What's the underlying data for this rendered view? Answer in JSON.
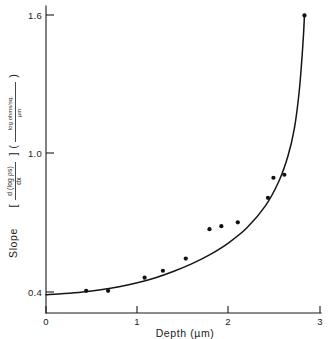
{
  "chart_data": {
    "type": "scatter",
    "title": "",
    "xlabel": "Depth  (µm)",
    "ylabel": "Slope [ d(log ρs)/dx ] ( log ohms/sq. / µm )",
    "xlim": [
      0,
      3
    ],
    "ylim": [
      0.4,
      1.6
    ],
    "xticks": [
      "0",
      "1",
      "2",
      "3"
    ],
    "xtick_values": [
      0,
      1,
      2,
      3
    ],
    "yticks": [
      "0.4",
      "1.0",
      "1.6"
    ],
    "ytick_values": [
      0.4,
      1.0,
      1.6
    ],
    "grid": false,
    "legend": "none",
    "series": [
      {
        "name": "measured slope",
        "marker": "filled-circle",
        "points": [
          {
            "x": 0.44,
            "y": 0.405
          },
          {
            "x": 0.68,
            "y": 0.405
          },
          {
            "x": 1.08,
            "y": 0.462
          },
          {
            "x": 1.28,
            "y": 0.492
          },
          {
            "x": 1.53,
            "y": 0.545
          },
          {
            "x": 1.79,
            "y": 0.672
          },
          {
            "x": 1.92,
            "y": 0.685
          },
          {
            "x": 2.1,
            "y": 0.702
          },
          {
            "x": 2.43,
            "y": 0.808
          },
          {
            "x": 2.49,
            "y": 0.895
          },
          {
            "x": 2.61,
            "y": 0.908
          },
          {
            "x": 2.83,
            "y": 1.598
          }
        ]
      },
      {
        "name": "fitted curve",
        "marker": "none",
        "points": [
          {
            "x": 0.0,
            "y": 0.388
          },
          {
            "x": 0.2,
            "y": 0.393
          },
          {
            "x": 0.4,
            "y": 0.4
          },
          {
            "x": 0.6,
            "y": 0.41
          },
          {
            "x": 0.8,
            "y": 0.423
          },
          {
            "x": 1.0,
            "y": 0.44
          },
          {
            "x": 1.2,
            "y": 0.462
          },
          {
            "x": 1.4,
            "y": 0.49
          },
          {
            "x": 1.6,
            "y": 0.523
          },
          {
            "x": 1.8,
            "y": 0.563
          },
          {
            "x": 2.0,
            "y": 0.613
          },
          {
            "x": 2.2,
            "y": 0.678
          },
          {
            "x": 2.4,
            "y": 0.772
          },
          {
            "x": 2.55,
            "y": 0.88
          },
          {
            "x": 2.65,
            "y": 0.99
          },
          {
            "x": 2.72,
            "y": 1.11
          },
          {
            "x": 2.77,
            "y": 1.26
          },
          {
            "x": 2.8,
            "y": 1.4
          },
          {
            "x": 2.82,
            "y": 1.52
          },
          {
            "x": 2.83,
            "y": 1.6
          }
        ]
      }
    ]
  },
  "axes": {
    "y_axis_label_parts": {
      "lead": "Slope",
      "open_bracket": "[",
      "numerator_main": "d (log ρs)",
      "denominator_main": "dx",
      "close_bracket": "]",
      "open_paren": "(",
      "numerator_unit": "log ohms/sq.",
      "denominator_unit": "µm",
      "close_paren": ")"
    },
    "x_axis_title": "Depth  (µm)",
    "x_tick_0": "0",
    "x_tick_1": "1",
    "x_tick_2": "2",
    "x_tick_3": "3",
    "y_tick_low": "0.4",
    "y_tick_mid": "1.0",
    "y_tick_high": "1.6"
  },
  "colors": {
    "ink": "#1a1a1a",
    "curve": "#141414",
    "marker": "#111111",
    "background": "#ffffff"
  }
}
